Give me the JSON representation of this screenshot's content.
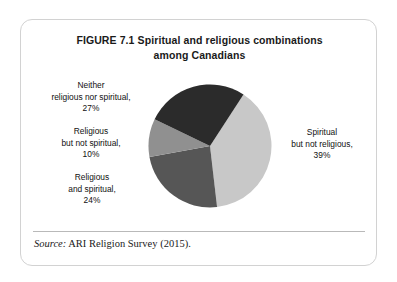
{
  "figure": {
    "number": "FIGURE 7.1",
    "title_line1": "Spiritual and religious combinations",
    "title_line2": "among Canadians",
    "source_label": "Source:",
    "source_text": "ARI Religion Survey (2015)."
  },
  "labels": {
    "neither": {
      "line1": "Neither",
      "line2": "religious nor spiritual,",
      "line3": "27%"
    },
    "religious_only": {
      "line1": "Religious",
      "line2": "but not spiritual,",
      "line3": "10%"
    },
    "religious_spiritual": {
      "line1": "Religious",
      "line2": "and spiritual,",
      "line3": "24%"
    },
    "spiritual_only": {
      "line1": "Spiritual",
      "line2": "but not religious,",
      "line3": "39%"
    }
  },
  "chart_data": {
    "type": "pie",
    "xlabel": "",
    "ylabel": "",
    "legend_position": "none",
    "grid": false,
    "value_unit": "percent",
    "start_angle_deg": 33,
    "direction": "clockwise",
    "categories": [
      "Spiritual but not religious",
      "Religious and spiritual",
      "Religious but not spiritual",
      "Neither religious nor spiritual"
    ],
    "values": [
      39,
      24,
      10,
      27
    ],
    "colors": [
      "#c8c8c8",
      "#565656",
      "#909090",
      "#2b2b2b"
    ],
    "slices": [
      {
        "label": "Spiritual but not religious",
        "value": 39,
        "display": "39%",
        "color": "#c8c8c8",
        "start_deg": 33,
        "end_deg": 173.4
      },
      {
        "label": "Religious and spiritual",
        "value": 24,
        "display": "24%",
        "color": "#565656",
        "start_deg": 173.4,
        "end_deg": 259.8
      },
      {
        "label": "Religious but not spiritual",
        "value": 10,
        "display": "10%",
        "color": "#909090",
        "start_deg": 259.8,
        "end_deg": 295.8
      },
      {
        "label": "Neither religious nor spiritual",
        "value": 27,
        "display": "27%",
        "color": "#2b2b2b",
        "start_deg": 295.8,
        "end_deg": 393
      }
    ],
    "source": "ARI Religion Survey (2015)."
  }
}
